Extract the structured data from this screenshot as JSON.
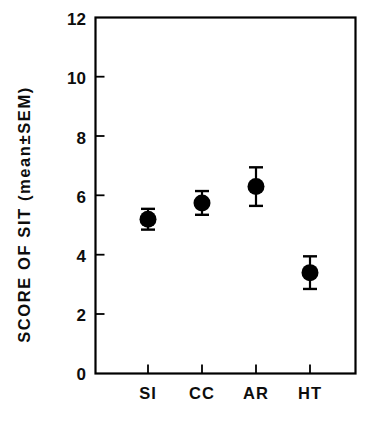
{
  "chart_data": {
    "type": "scatter",
    "title": "",
    "subtitle": "",
    "xlabel": "",
    "ylabel": "SCORE OF SIT (mean±SEM)",
    "categories": [
      "SI",
      "CC",
      "AR",
      "HT"
    ],
    "values": [
      5.2,
      5.75,
      6.3,
      3.4
    ],
    "errors": [
      0.35,
      0.4,
      0.65,
      0.55
    ],
    "error_type": "SEM",
    "ylim": [
      0,
      12
    ],
    "ytick_labels": [
      "0",
      "2",
      "4",
      "6",
      "8",
      "10",
      "12"
    ],
    "ytick_values": [
      0,
      2,
      4,
      6,
      8,
      10,
      12
    ],
    "grid": false,
    "legend": null,
    "marker": "filled-circle",
    "marker_color": "#000000",
    "axis_color": "#000000",
    "background": "#ffffff",
    "series": [
      {
        "name": "Score of SIT",
        "points": [
          {
            "category": "SI",
            "mean": 5.2,
            "sem": 0.35,
            "low": 4.85,
            "high": 5.55
          },
          {
            "category": "CC",
            "mean": 5.75,
            "sem": 0.4,
            "low": 5.35,
            "high": 6.15
          },
          {
            "category": "AR",
            "mean": 6.3,
            "sem": 0.65,
            "low": 5.65,
            "high": 6.95
          },
          {
            "category": "HT",
            "mean": 3.4,
            "sem": 0.55,
            "low": 2.85,
            "high": 3.95
          }
        ]
      }
    ]
  },
  "axes": {
    "y_title": "SCORE OF SIT (mean±SEM)",
    "y_ticks": [
      "12",
      "10",
      "8",
      "6",
      "4",
      "2",
      "0"
    ],
    "x_ticks": [
      "SI",
      "CC",
      "AR",
      "HT"
    ]
  }
}
